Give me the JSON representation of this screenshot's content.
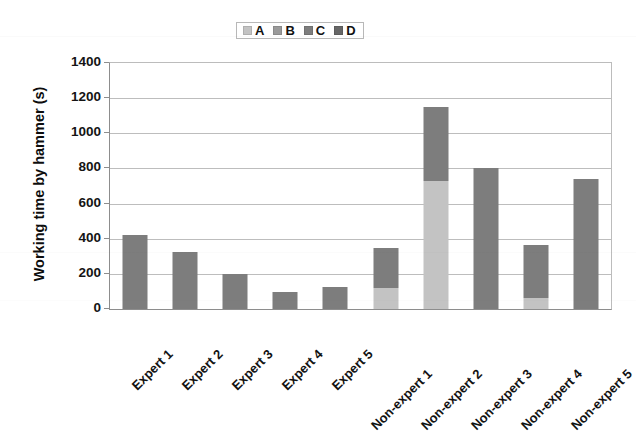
{
  "chart_data": {
    "type": "bar",
    "subtype": "stacked-bar",
    "title": "",
    "xlabel": "",
    "ylabel": "Working time by hammer (s)",
    "ylim": [
      0,
      1400
    ],
    "ytick_step": 200,
    "yticks": [
      0,
      200,
      400,
      600,
      800,
      1000,
      1200,
      1400
    ],
    "ytick_labels": [
      "0",
      "200",
      "400",
      "600",
      "800",
      "1000",
      "1200",
      "1400"
    ],
    "grid": true,
    "legend_position": "top-center",
    "categories": [
      "Expert 1",
      "Expert 2",
      "Expert 3",
      "Expert 4",
      "Expert 5",
      "Non-expert 1",
      "Non-expert 2",
      "Non-expert 3",
      "Non-expert 4",
      "Non-expert 5"
    ],
    "series": [
      {
        "name": "A",
        "color": "#c3c3c3",
        "values": [
          0,
          0,
          0,
          0,
          0,
          120,
          730,
          0,
          60,
          0
        ]
      },
      {
        "name": "B",
        "color": "#9a9a9a",
        "values": [
          0,
          0,
          0,
          0,
          0,
          0,
          0,
          0,
          0,
          0
        ]
      },
      {
        "name": "C",
        "color": "#7d7d7d",
        "values": [
          420,
          325,
          200,
          95,
          125,
          230,
          420,
          800,
          305,
          740
        ]
      },
      {
        "name": "D",
        "color": "#666666",
        "values": [
          0,
          0,
          0,
          0,
          0,
          0,
          0,
          0,
          0,
          0
        ]
      }
    ],
    "totals": [
      420,
      325,
      200,
      95,
      125,
      350,
      1150,
      800,
      365,
      740
    ]
  },
  "legend": {
    "entries": [
      {
        "label": "A",
        "color": "#c3c3c3"
      },
      {
        "label": "B",
        "color": "#9a9a9a"
      },
      {
        "label": "C",
        "color": "#7d7d7d"
      },
      {
        "label": "D",
        "color": "#666666"
      }
    ]
  },
  "axes": {
    "y_title": "Working time by hammer (s)"
  }
}
